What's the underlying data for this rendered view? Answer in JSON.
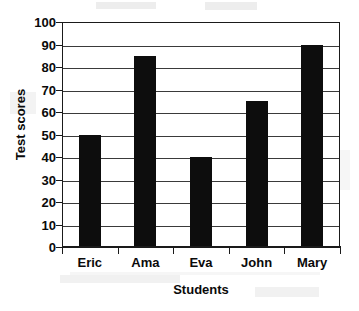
{
  "chart_data": {
    "type": "bar",
    "title": "",
    "xlabel": "Students",
    "ylabel": "Test scores",
    "categories": [
      "Eric",
      "Ama",
      "Eva",
      "John",
      "Mary"
    ],
    "values": [
      50,
      85,
      40,
      65,
      90
    ],
    "ylim": [
      0,
      100
    ],
    "ytick_step": 10,
    "yticks": [
      0,
      10,
      20,
      30,
      40,
      50,
      60,
      70,
      80,
      90,
      100
    ],
    "ytick_labels": [
      "0",
      "10",
      "20",
      "30",
      "40",
      "50",
      "60",
      "70",
      "80",
      "90",
      "100"
    ],
    "grid": true,
    "grid_axis": "y",
    "legend": false,
    "bar_color": "#0d0d0d",
    "axis_color": "#1a1a1a",
    "grid_color": "#3a3a3a",
    "background": "#ffffff"
  }
}
